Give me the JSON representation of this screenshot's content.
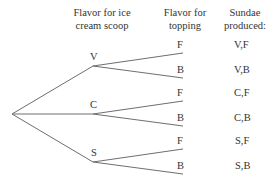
{
  "headers": {
    "scoop": [
      "Flavor for ice",
      "cream scoop"
    ],
    "topping": [
      "Flavor for",
      "topping"
    ],
    "sundae": [
      "Sundae",
      "produced:"
    ]
  },
  "scoops": [
    {
      "label": "V",
      "toppings": [
        {
          "label": "F",
          "result": "V,F"
        },
        {
          "label": "B",
          "result": "V,B"
        }
      ]
    },
    {
      "label": "C",
      "toppings": [
        {
          "label": "F",
          "result": "C,F"
        },
        {
          "label": "B",
          "result": "C,B"
        }
      ]
    },
    {
      "label": "S",
      "toppings": [
        {
          "label": "F",
          "result": "S,F"
        },
        {
          "label": "B",
          "result": "S,B"
        }
      ]
    }
  ],
  "colors": {
    "line": "#6e6e6e",
    "text": "#333333"
  }
}
